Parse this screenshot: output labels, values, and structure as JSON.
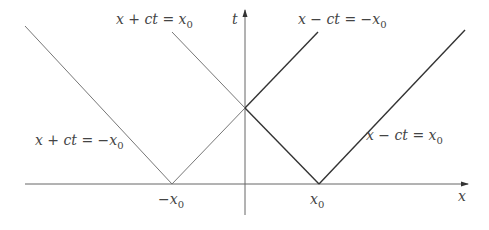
{
  "diagram": {
    "title": "",
    "axes": {
      "x_label": "x",
      "t_label": "t"
    },
    "ticks": {
      "neg_x0": "−x",
      "pos_x0": "x",
      "subscript": "0"
    },
    "lines": [
      {
        "id": "left-char-plus",
        "equation_lhs": "x + ct = −x",
        "subscript": "0"
      },
      {
        "id": "top-char-plus",
        "equation_lhs": "x + ct = x",
        "subscript": "0"
      },
      {
        "id": "top-char-minus",
        "equation_lhs": "x − ct = −x",
        "subscript": "0"
      },
      {
        "id": "right-char-minus",
        "equation_lhs": "x − ct = x",
        "subscript": "0"
      }
    ],
    "colors": {
      "axis": "#555555",
      "thin_line": "#777777",
      "thick_line": "#333333",
      "text": "#444444"
    }
  }
}
